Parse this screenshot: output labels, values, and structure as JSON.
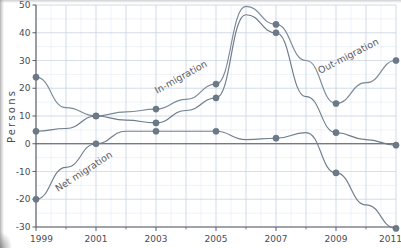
{
  "chart_data": {
    "type": "line",
    "title": "",
    "subtitle": "",
    "xlabel": "",
    "ylabel": "Persons",
    "xlim": [
      1999,
      2011
    ],
    "ylim": [
      -30,
      50
    ],
    "ytick_step": 10,
    "xtick_step": 1,
    "xtick_label_step": 2,
    "grid": true,
    "grid_minor": true,
    "legend": "inline-labels",
    "x": [
      1999,
      2000,
      2001,
      2002,
      2003,
      2004,
      2005,
      2006,
      2007,
      2008,
      2009,
      2010,
      2011
    ],
    "xtick_labels": [
      "1999",
      "2001",
      "2003",
      "2005",
      "2007",
      "2009",
      "2011"
    ],
    "ytick_labels": [
      "50",
      "40",
      "30",
      "20",
      "10",
      "0",
      "-10",
      "-20",
      "-30"
    ],
    "marker_years": [
      1999,
      2001,
      2003,
      2005,
      2007,
      2009,
      2011
    ],
    "series": [
      {
        "name": "Out-migration",
        "color": "#7d8a99",
        "values": [
          24,
          13,
          10,
          11.5,
          12.5,
          16,
          21.5,
          49.5,
          43,
          30,
          14.5,
          22,
          30
        ],
        "marker_values": [
          24,
          10,
          12.5,
          21.5,
          43,
          14.5,
          30
        ],
        "label": "Out-migration",
        "label_rotation": -27
      },
      {
        "name": "In-migration",
        "color": "#6f7c8b",
        "values": [
          4.5,
          5.5,
          10,
          8.5,
          7.5,
          12,
          16.5,
          46.5,
          40,
          17,
          4,
          1.5,
          -0.5
        ],
        "marker_values": [
          4.5,
          10,
          7.5,
          16.5,
          40,
          4,
          -0.5
        ],
        "label": "In-migration",
        "label_rotation": -29
      },
      {
        "name": "Net migration",
        "color": "#717e8d",
        "values": [
          -20,
          -8.5,
          0,
          4.5,
          4.5,
          4.5,
          4.5,
          1.5,
          2,
          4,
          -10.5,
          -22,
          -30.5
        ],
        "marker_values": [
          -20,
          0,
          4.5,
          4.5,
          2,
          -10.5,
          -30.5
        ],
        "label": "Net migration",
        "label_rotation": -33
      }
    ],
    "colors": {
      "line": "#74818f",
      "marker": "#6c7a88",
      "grid_major": "#c6d2e0",
      "grid_minor": "#dfe7f0",
      "axis": "#5b5b63",
      "text": "#4a4a52",
      "background": "#ffffff"
    }
  }
}
